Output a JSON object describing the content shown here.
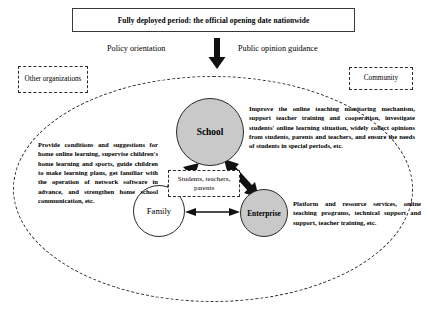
{
  "banner": {
    "title": "Fully deployed period: the official opening date nationwide"
  },
  "flow": {
    "left_label": "Policy orientation",
    "right_label": "Public opinion guidance",
    "arrow_icon": "down-arrow-icon"
  },
  "side_boxes": {
    "left": "Other organizations",
    "right": "Community"
  },
  "nodes": {
    "school": "School",
    "family": "Family",
    "enterprise": "Enterprise",
    "center_label": "Students, teachers, parents"
  },
  "descriptions": {
    "family": "Provide conditions and suggestions for home online learning, supervise children's home learning and sports, guide children to make learning plans, get familiar with the operation of network software in advance, and strengthen home school communication, etc.",
    "school": "Improve the online teaching monitoring mechanism, support teacher training and cooperation, investigate students' online learning situation, widely collect opinions from students, parents and teachers, and ensure the needs of students in special periods, etc.",
    "enterprise": "Platform and resource services, online teaching programs, technical support and support, teacher training, etc."
  },
  "colors": {
    "node_fill_gray": "#c9c9c9",
    "node_fill_white": "#ffffff",
    "stroke": "#2a2a2a"
  }
}
